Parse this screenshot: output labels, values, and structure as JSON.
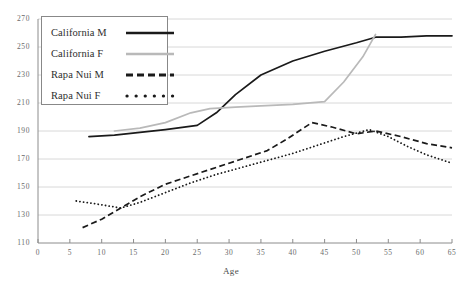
{
  "chart_data": {
    "type": "line",
    "title": "",
    "xlabel": "Age",
    "ylabel": "",
    "xlim": [
      0,
      65
    ],
    "ylim": [
      110,
      270
    ],
    "xticks": [
      0,
      5,
      10,
      15,
      20,
      25,
      30,
      35,
      40,
      45,
      50,
      55,
      60,
      65
    ],
    "yticks": [
      110,
      130,
      150,
      170,
      190,
      210,
      230,
      250,
      270
    ],
    "grid": "horizontal",
    "legend_position": "top-left",
    "series": [
      {
        "name": "California M",
        "style": "solid",
        "color": "#1a1a1a",
        "x": [
          8,
          12,
          16,
          20,
          25,
          28,
          31,
          35,
          40,
          45,
          50,
          53,
          57,
          61,
          65
        ],
        "values": [
          186,
          187,
          189,
          191,
          194,
          203,
          216,
          230,
          240,
          247,
          253,
          257,
          257,
          258,
          258
        ]
      },
      {
        "name": "California F",
        "style": "solid",
        "color": "#b9b9b9",
        "x": [
          12,
          16,
          20,
          24,
          27,
          31,
          35,
          40,
          45,
          48,
          51,
          53
        ],
        "values": [
          190,
          192,
          196,
          203,
          206,
          207,
          208,
          209,
          211,
          225,
          243,
          259
        ]
      },
      {
        "name": "Rapa Nui M",
        "style": "dashed",
        "color": "#1a1a1a",
        "x": [
          7,
          10,
          13,
          16,
          20,
          24,
          28,
          32,
          36,
          39,
          43,
          46,
          50,
          53,
          57,
          61,
          65
        ],
        "values": [
          121,
          127,
          135,
          143,
          152,
          158,
          164,
          170,
          176,
          184,
          196,
          193,
          188,
          190,
          186,
          181,
          178
        ]
      },
      {
        "name": "Rapa Nui F",
        "style": "dotted",
        "color": "#1a1a1a",
        "x": [
          6,
          9,
          13,
          16,
          20,
          24,
          28,
          32,
          36,
          40,
          44,
          48,
          52,
          55,
          58,
          61,
          65
        ],
        "values": [
          140,
          138,
          135,
          139,
          146,
          153,
          159,
          164,
          169,
          174,
          180,
          186,
          191,
          186,
          179,
          173,
          167
        ]
      }
    ]
  },
  "legend": {
    "items": [
      {
        "label": "California M",
        "swatch": "solid-black-line"
      },
      {
        "label": "California F",
        "swatch": "solid-gray-line"
      },
      {
        "label": "Rapa Nui M",
        "swatch": "dashed-black-line"
      },
      {
        "label": "Rapa Nui F",
        "swatch": "dotted-black-line"
      }
    ]
  },
  "axes": {
    "x_title": "Age",
    "x_tick_labels": [
      "0",
      "5",
      "10",
      "15",
      "20",
      "25",
      "30",
      "35",
      "40",
      "45",
      "50",
      "55",
      "60",
      "65"
    ],
    "y_tick_labels": [
      "110",
      "130",
      "150",
      "170",
      "190",
      "210",
      "230",
      "250",
      "270"
    ]
  },
  "colors": {
    "california_m": "#1a1a1a",
    "california_f": "#b9b9b9",
    "rapa_nui": "#1a1a1a",
    "grid": "#d8d8d8",
    "axis": "#8c8c8c",
    "tick_text": "#6a6a6a"
  }
}
